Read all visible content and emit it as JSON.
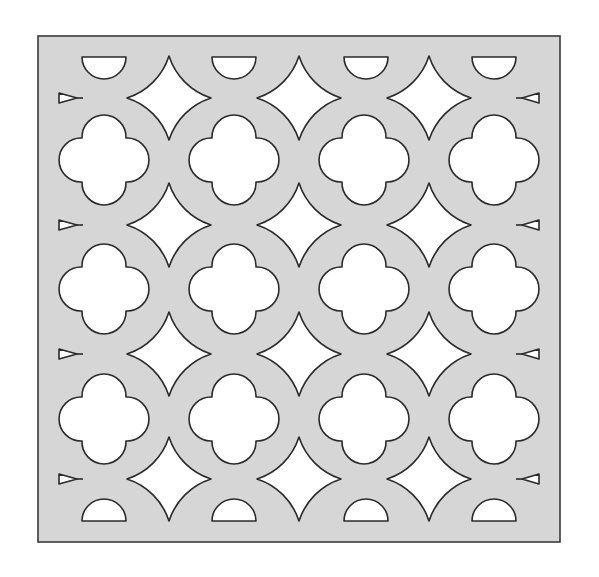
{
  "diagram": {
    "colors": {
      "panel_fill": "#d6d6d6",
      "outline": "#2a2a2a",
      "cutout": "#ffffff",
      "background": "#ffffff"
    },
    "panel": {
      "x": 38,
      "y": 36,
      "width": 522,
      "height": 506
    },
    "quatrefoils": {
      "lobe_radius": 22,
      "lobe_offset": 21,
      "cols_x": [
        104,
        234,
        364,
        494
      ],
      "rows_y": [
        160,
        289,
        419
      ]
    },
    "stars": {
      "arc_radius": 65,
      "half_size": 42,
      "cols_x": [
        169,
        299,
        429
      ],
      "rows_y": [
        98,
        225,
        354,
        479
      ]
    },
    "edge_triangles": {
      "left": {
        "base_x": 59,
        "tip_x": 83,
        "half_height": 5
      },
      "right": {
        "base_x": 539,
        "tip_x": 516,
        "half_height": 5
      },
      "rows_y": [
        98,
        225,
        354,
        479
      ]
    },
    "half_circles": {
      "radius": 22,
      "cols_x": [
        104,
        234,
        366,
        494
      ],
      "top_y": 57,
      "bottom_y": 521
    }
  }
}
